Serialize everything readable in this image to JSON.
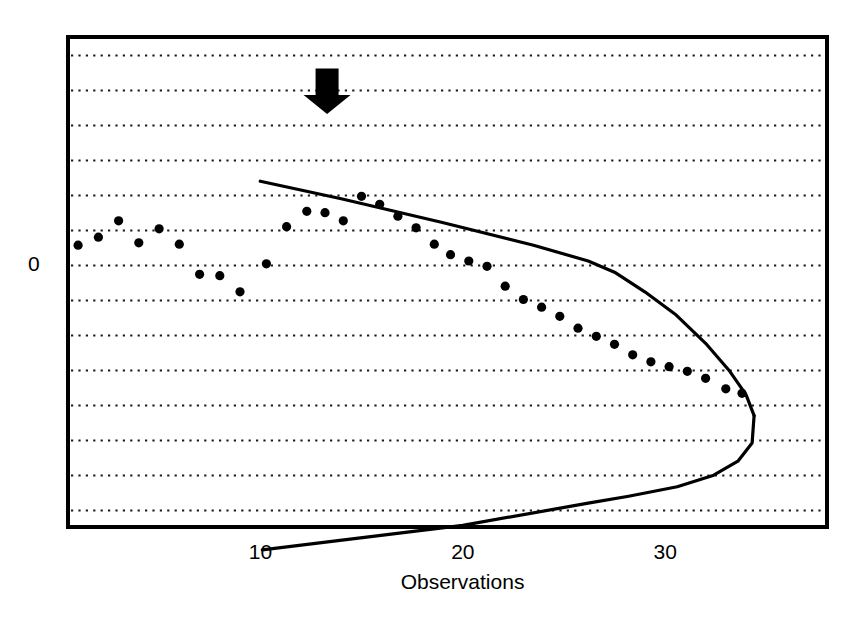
{
  "chart_data": {
    "type": "scatter",
    "title": "",
    "subtitle": "",
    "xlabel": "Observations",
    "ylabel": "",
    "xlim": [
      0.5,
      38.0
    ],
    "ylim": [
      -7.5,
      6.5
    ],
    "xticks": [
      10,
      20,
      30
    ],
    "xtick_labels": [
      "10",
      "20",
      "30"
    ],
    "yticks": [
      0
    ],
    "ytick_labels": [
      "0"
    ],
    "grid": {
      "horizontal": true,
      "vertical": false,
      "style": "dotted",
      "color": "#000000",
      "y_values": [
        6,
        5,
        4,
        3,
        2,
        1,
        0,
        -1,
        -2,
        -3,
        -4,
        -5,
        -6,
        -7
      ]
    },
    "legend": {
      "visible": false,
      "position": "none"
    },
    "frame": {
      "visible": true,
      "color": "#000000",
      "line_width": 3
    },
    "series": [
      {
        "name": "cumulative-sum-points",
        "type": "scatter",
        "marker": "filled-circle",
        "color": "#000000",
        "points": [
          {
            "x": 1.0,
            "y": 0.55
          },
          {
            "x": 2.0,
            "y": 0.78
          },
          {
            "x": 3.0,
            "y": 1.25
          },
          {
            "x": 4.0,
            "y": 0.62
          },
          {
            "x": 5.0,
            "y": 1.02
          },
          {
            "x": 6.0,
            "y": 0.58
          },
          {
            "x": 7.0,
            "y": -0.28
          },
          {
            "x": 8.0,
            "y": -0.32
          },
          {
            "x": 9.0,
            "y": -0.78
          },
          {
            "x": 10.3,
            "y": 0.02
          },
          {
            "x": 11.3,
            "y": 1.08
          },
          {
            "x": 12.3,
            "y": 1.52
          },
          {
            "x": 13.2,
            "y": 1.48
          },
          {
            "x": 14.1,
            "y": 1.25
          },
          {
            "x": 15.0,
            "y": 1.95
          },
          {
            "x": 15.9,
            "y": 1.72
          },
          {
            "x": 16.8,
            "y": 1.38
          },
          {
            "x": 17.7,
            "y": 1.05
          },
          {
            "x": 18.6,
            "y": 0.58
          },
          {
            "x": 19.4,
            "y": 0.28
          },
          {
            "x": 20.3,
            "y": 0.1
          },
          {
            "x": 21.2,
            "y": -0.05
          },
          {
            "x": 22.1,
            "y": -0.62
          },
          {
            "x": 23.0,
            "y": -1.0
          },
          {
            "x": 23.9,
            "y": -1.22
          },
          {
            "x": 24.8,
            "y": -1.48
          },
          {
            "x": 25.7,
            "y": -1.82
          },
          {
            "x": 26.6,
            "y": -2.05
          },
          {
            "x": 27.5,
            "y": -2.28
          },
          {
            "x": 28.4,
            "y": -2.58
          },
          {
            "x": 29.3,
            "y": -2.78
          },
          {
            "x": 30.2,
            "y": -2.92
          },
          {
            "x": 31.1,
            "y": -3.05
          },
          {
            "x": 32.0,
            "y": -3.25
          },
          {
            "x": 33.0,
            "y": -3.55
          },
          {
            "x": 33.8,
            "y": -3.68
          }
        ]
      },
      {
        "name": "upper-decision-boundary",
        "type": "line",
        "color": "#000000",
        "line_width": 3,
        "points": [
          {
            "x": 10.0,
            "y": 2.38
          },
          {
            "x": 14.0,
            "y": 1.88
          },
          {
            "x": 19.0,
            "y": 1.2
          },
          {
            "x": 23.5,
            "y": 0.55
          },
          {
            "x": 26.2,
            "y": 0.1
          },
          {
            "x": 27.5,
            "y": -0.22
          },
          {
            "x": 29.0,
            "y": -0.78
          },
          {
            "x": 30.5,
            "y": -1.42
          },
          {
            "x": 32.0,
            "y": -2.25
          },
          {
            "x": 33.2,
            "y": -3.05
          },
          {
            "x": 34.0,
            "y": -3.72
          },
          {
            "x": 34.4,
            "y": -4.32
          }
        ]
      },
      {
        "name": "lower-decision-boundary",
        "type": "line",
        "color": "#000000",
        "line_width": 3,
        "points": [
          {
            "x": 34.4,
            "y": -4.32
          },
          {
            "x": 34.3,
            "y": -5.1
          },
          {
            "x": 33.6,
            "y": -5.62
          },
          {
            "x": 32.4,
            "y": -6.02
          },
          {
            "x": 30.6,
            "y": -6.35
          },
          {
            "x": 28.2,
            "y": -6.62
          },
          {
            "x": 26.2,
            "y": -6.82
          },
          {
            "x": 20.0,
            "y": -7.45
          },
          {
            "x": 10.1,
            "y": -8.15
          }
        ]
      }
    ],
    "annotations": [
      {
        "name": "out-of-control-arrow",
        "type": "down-arrow",
        "color": "#000000",
        "x": 13.3,
        "y_top": 5.6,
        "y_bottom": 4.3,
        "description": "solid black downward block arrow marking signal point"
      }
    ]
  },
  "axes": {
    "x_tick_labels": [
      {
        "text": "10",
        "x": 10
      },
      {
        "text": "20",
        "x": 20
      },
      {
        "text": "30",
        "x": 30
      }
    ],
    "x_axis_title": "Observations",
    "y_tick_labels": [
      {
        "text": "0",
        "y": 0
      }
    ]
  },
  "colors": {
    "foreground": "#000000",
    "background": "#ffffff",
    "grid": "#1a1a1a"
  }
}
